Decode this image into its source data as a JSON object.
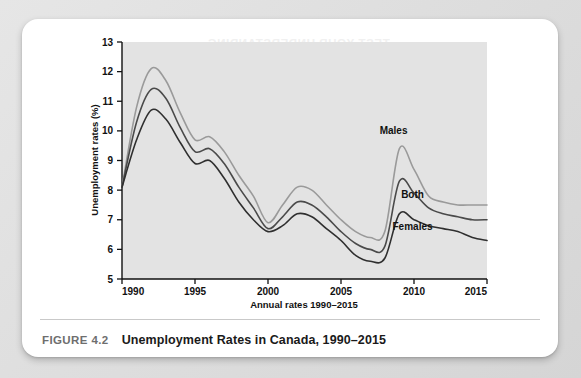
{
  "caption": {
    "figure_number": "FIGURE 4.2",
    "title": "Unemployment Rates in Canada, 1990–2015"
  },
  "ghost_text": {
    "heading": "TEST YOUR UNDERSTANDING",
    "line1": "of unemployment would you",
    "line2": "between 1990 and 2015?",
    "line3": "rate of 1992 and that of 2009?"
  },
  "chart_data": {
    "type": "line",
    "title": "Unemployment Rates in Canada, 1990–2015",
    "xlabel": "Annual rates 1990–2015",
    "ylabel": "Unemployment rates (%)",
    "xlim": [
      1990,
      2015
    ],
    "ylim": [
      5,
      13
    ],
    "xticks": [
      1990,
      1995,
      2000,
      2005,
      2010,
      2015
    ],
    "xtick_labels": [
      "1990",
      "1995",
      "2000",
      "2005",
      "2010",
      "2015"
    ],
    "yticks": [
      5,
      6,
      7,
      8,
      9,
      10,
      11,
      12,
      13
    ],
    "ytick_labels": [
      "5",
      "6",
      "7",
      "8",
      "9",
      "10",
      "11",
      "12",
      "13"
    ],
    "grid": false,
    "legend_position": "inline-annotations",
    "plot_background": "#e3e3e3",
    "x": [
      1990,
      1991,
      1992,
      1993,
      1994,
      1995,
      1996,
      1997,
      1998,
      1999,
      2000,
      2001,
      2002,
      2003,
      2004,
      2005,
      2006,
      2007,
      2008,
      2009,
      2010,
      2011,
      2012,
      2013,
      2014,
      2015
    ],
    "series": [
      {
        "name": "Males",
        "color": "#9a9a9a",
        "values": [
          8.1,
          10.8,
          12.1,
          11.7,
          10.6,
          9.7,
          9.8,
          9.3,
          8.5,
          7.8,
          6.9,
          7.5,
          8.1,
          8.0,
          7.5,
          7.0,
          6.6,
          6.4,
          6.6,
          9.4,
          8.7,
          7.8,
          7.6,
          7.5,
          7.5,
          7.5
        ]
      },
      {
        "name": "Both",
        "color": "#4a4a4a",
        "values": [
          8.1,
          10.3,
          11.4,
          11.1,
          10.1,
          9.3,
          9.4,
          8.9,
          8.1,
          7.4,
          6.7,
          7.1,
          7.6,
          7.5,
          7.1,
          6.6,
          6.2,
          6.0,
          6.1,
          8.3,
          7.9,
          7.4,
          7.2,
          7.1,
          7.0,
          7.0
        ]
      },
      {
        "name": "Females",
        "color": "#2f2f2f",
        "values": [
          8.1,
          9.7,
          10.7,
          10.4,
          9.6,
          8.9,
          9.0,
          8.4,
          7.6,
          7.0,
          6.6,
          6.8,
          7.2,
          7.1,
          6.7,
          6.3,
          5.8,
          5.6,
          5.7,
          7.2,
          7.0,
          6.8,
          6.7,
          6.6,
          6.4,
          6.3
        ]
      }
    ],
    "annotations": [
      {
        "text": "Males",
        "x": 2008.6,
        "y": 9.9
      },
      {
        "text": "Both",
        "x": 2009.9,
        "y": 7.75
      },
      {
        "text": "Females",
        "x": 2009.9,
        "y": 6.65
      }
    ]
  }
}
